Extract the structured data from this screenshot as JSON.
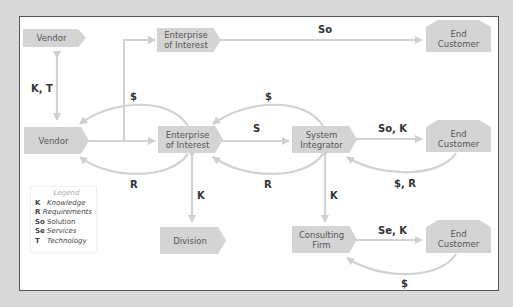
{
  "nodes": {
    "vendor_top": "Vendor",
    "enterprise_top_1": "Enterprise",
    "enterprise_top_2": "of Interest",
    "end_customer_top_1": "End",
    "end_customer_top_2": "Customer",
    "vendor_mid": "Vendor",
    "enterprise_mid_1": "Enterprise",
    "enterprise_mid_2": "of Interest",
    "system_integrator_1": "System",
    "system_integrator_2": "Integrator",
    "end_customer_mid_1": "End",
    "end_customer_mid_2": "Customer",
    "division": "Division",
    "consulting_firm_1": "Consulting",
    "consulting_firm_2": "Firm",
    "end_customer_bot_1": "End",
    "end_customer_bot_2": "Customer"
  },
  "edge_labels": {
    "vendor_vendor": "K, T",
    "enterprise_to_endcustomer_top": "So",
    "enterprise_to_vendor_money": "$",
    "si_to_enterprise_money": "$",
    "enterprise_to_si": "S",
    "si_to_endcustomer": "So, K",
    "vendor_requirements": "R",
    "si_requirements": "R",
    "endcustomer_to_si": "$, R",
    "enterprise_division": "K",
    "si_consulting": "K",
    "consulting_to_endcustomer": "Se, K",
    "endcustomer_to_consulting": "$"
  },
  "legend": {
    "title": "Legend",
    "items": [
      {
        "key": "K",
        "value": "Knowledge"
      },
      {
        "key": "R",
        "value": "Requirements"
      },
      {
        "key": "So",
        "value": "Solution"
      },
      {
        "key": "Se",
        "value": "Services"
      },
      {
        "key": "T",
        "value": "Technology"
      }
    ]
  },
  "colors": {
    "node_fill": "#d4d4d4",
    "arrow": "#d0d0d0",
    "frame_border": "#555555",
    "background": "#d9d9d9"
  }
}
